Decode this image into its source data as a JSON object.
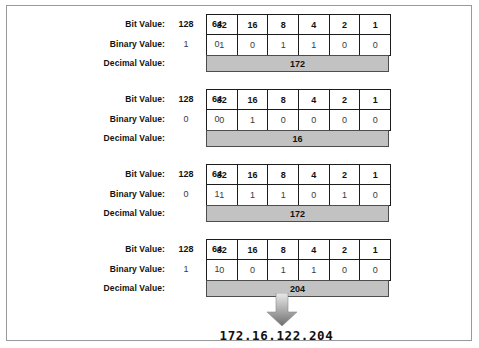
{
  "figure": {
    "result": "172.16.122.204",
    "arrow_icon": "down-arrow-icon",
    "colors": {
      "frame_border": "#9a9a9a",
      "grid_border": "#1c1c1c",
      "decimal_fill": "#c2c2c2",
      "text": "#111111"
    }
  },
  "labels": {
    "bit_value": "Bit Value:",
    "binary_value": "Binary Value:",
    "decimal_value": "Decimal Value:"
  },
  "bit_weights": {
    "loose": [
      "128",
      "64"
    ],
    "boxed": [
      "32",
      "16",
      "8",
      "4",
      "2",
      "1"
    ]
  },
  "octets": [
    {
      "name": "octet-1",
      "bit_value_loose": [
        "128",
        "64"
      ],
      "bit_value_boxed": [
        "32",
        "16",
        "8",
        "4",
        "2",
        "1"
      ],
      "binary_loose": [
        "1",
        "0"
      ],
      "binary_boxed": [
        "1",
        "0",
        "1",
        "1",
        "0",
        "0"
      ],
      "decimal": "172"
    },
    {
      "name": "octet-2",
      "bit_value_loose": [
        "128",
        "64"
      ],
      "bit_value_boxed": [
        "32",
        "16",
        "8",
        "4",
        "2",
        "1"
      ],
      "binary_loose": [
        "0",
        "0"
      ],
      "binary_boxed": [
        "0",
        "1",
        "0",
        "0",
        "0",
        "0"
      ],
      "decimal": "16"
    },
    {
      "name": "octet-3",
      "bit_value_loose": [
        "128",
        "64"
      ],
      "bit_value_boxed": [
        "32",
        "16",
        "8",
        "4",
        "2",
        "1"
      ],
      "binary_loose": [
        "0",
        "1"
      ],
      "binary_boxed": [
        "1",
        "1",
        "1",
        "0",
        "1",
        "0"
      ],
      "decimal": "172"
    },
    {
      "name": "octet-4",
      "bit_value_loose": [
        "128",
        "64"
      ],
      "bit_value_boxed": [
        "32",
        "16",
        "8",
        "4",
        "2",
        "1"
      ],
      "binary_loose": [
        "1",
        "1"
      ],
      "binary_boxed": [
        "0",
        "0",
        "1",
        "1",
        "0",
        "0"
      ],
      "decimal": "204"
    }
  ]
}
